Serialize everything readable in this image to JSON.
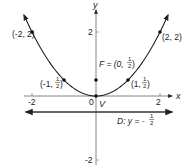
{
  "diagram": {
    "type": "parabola-focus-directrix",
    "equation": "x^2 = 2y",
    "axes": {
      "x_label": "x",
      "y_label": "y",
      "x_ticks": [
        {
          "value": -2,
          "label": "-2"
        },
        {
          "value": 0,
          "label": "0"
        },
        {
          "value": 2,
          "label": "2"
        }
      ],
      "y_ticks": [
        {
          "value": 2,
          "label": "2"
        },
        {
          "value": -2,
          "label": "-2"
        }
      ],
      "x_range": [
        -2.2,
        2.4
      ],
      "y_range": [
        -2.2,
        2.8
      ]
    },
    "points": [
      {
        "id": "p-neg2",
        "x": -2,
        "y": 2,
        "label": "(-2, 2)"
      },
      {
        "id": "p-neg1",
        "x": -1,
        "y": 0.5,
        "label_pre": "(-1, ",
        "frac_num": "1",
        "frac_den": "2",
        "label_post": ")"
      },
      {
        "id": "p-pos1",
        "x": 1,
        "y": 0.5,
        "label_pre": "(1, ",
        "frac_num": "1",
        "frac_den": "2",
        "label_post": ")"
      },
      {
        "id": "p-pos2",
        "x": 2,
        "y": 2,
        "label": "(2, 2)"
      }
    ],
    "focus": {
      "x": 0,
      "y": 0.5,
      "label_pre": "F = (0, ",
      "frac_num": "1",
      "frac_den": "2",
      "label_post": ")"
    },
    "vertex": {
      "x": 0,
      "y": 0,
      "label": "V"
    },
    "directrix": {
      "y": -0.5,
      "label_pre": "D: y = -",
      "frac_num": "1",
      "frac_den": "2"
    }
  }
}
